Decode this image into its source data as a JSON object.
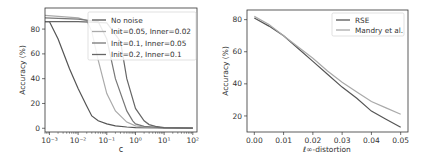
{
  "chart_data": [
    {
      "type": "line",
      "title": "",
      "xlabel": "c",
      "ylabel": "Accuracy (%)",
      "xscale": "log",
      "xlim": [
        0.0007,
        140
      ],
      "ylim": [
        -3,
        97
      ],
      "xticks": [
        0.001,
        0.01,
        0.1,
        1,
        10,
        100
      ],
      "xtick_labels": [
        "10⁻³",
        "10⁻²",
        "10⁻¹",
        "10⁰",
        "10¹",
        "10²"
      ],
      "yticks": [
        0,
        20,
        40,
        60,
        80
      ],
      "ytick_labels": [
        "0",
        "20",
        "40",
        "60",
        "80"
      ],
      "grid": false,
      "legend_position": "upper right",
      "series": [
        {
          "name": "No noise",
          "color": "#555555",
          "x": [
            0.0007,
            0.001,
            0.002,
            0.005,
            0.01,
            0.02,
            0.03,
            0.05,
            0.1,
            0.2,
            0.5,
            1,
            10,
            100
          ],
          "y": [
            86,
            86,
            72,
            48,
            32,
            18,
            10,
            6,
            3.5,
            2,
            1,
            0.5,
            0.2,
            0.1
          ]
        },
        {
          "name": "Init=0.05, Inner=0.02",
          "color": "#aaaaaa",
          "x": [
            0.0007,
            0.01,
            0.02,
            0.03,
            0.05,
            0.1,
            0.2,
            0.5,
            1,
            2,
            10,
            100
          ],
          "y": [
            91,
            89,
            87,
            78,
            55,
            28,
            14,
            5,
            2,
            1,
            0.3,
            0.1
          ]
        },
        {
          "name": "Init=0.1, Inner=0.05",
          "color": "#777777",
          "x": [
            0.0007,
            0.01,
            0.05,
            0.1,
            0.2,
            0.5,
            0.8,
            1,
            2,
            10,
            100
          ],
          "y": [
            89,
            88,
            86,
            72,
            40,
            14,
            6,
            3.5,
            1.5,
            0.3,
            0.1
          ]
        },
        {
          "name": "Init=0.2, Inner=0.1",
          "color": "#666666",
          "x": [
            0.0007,
            0.01,
            0.1,
            0.3,
            0.5,
            1,
            2,
            3,
            5,
            10,
            100
          ],
          "y": [
            86,
            86,
            85,
            70,
            40,
            16,
            6,
            3,
            1.5,
            0.5,
            0.1
          ]
        }
      ]
    },
    {
      "type": "line",
      "title": "",
      "xlabel": "ℓ∞-distortion",
      "ylabel": "Accuracy (%)",
      "xlim": [
        -0.0025,
        0.0525
      ],
      "ylim": [
        10,
        86
      ],
      "xticks": [
        0.0,
        0.01,
        0.02,
        0.03,
        0.04,
        0.05
      ],
      "xtick_labels": [
        "0.00",
        "0.01",
        "0.02",
        "0.03",
        "0.04",
        "0.05"
      ],
      "yticks": [
        20,
        40,
        60,
        80
      ],
      "ytick_labels": [
        "20",
        "40",
        "60",
        "80"
      ],
      "grid": false,
      "legend_position": "upper right",
      "series": [
        {
          "name": "RSE",
          "color": "#555555",
          "x": [
            0.0,
            0.005,
            0.01,
            0.015,
            0.02,
            0.025,
            0.03,
            0.035,
            0.04,
            0.045,
            0.05
          ],
          "y": [
            81,
            76,
            70,
            62,
            54,
            46,
            38,
            31,
            23,
            18,
            13
          ]
        },
        {
          "name": "Mandry et al.",
          "color": "#aaaaaa",
          "x": [
            0.0,
            0.005,
            0.01,
            0.015,
            0.02,
            0.025,
            0.03,
            0.035,
            0.04,
            0.045,
            0.05
          ],
          "y": [
            82,
            77,
            70,
            63,
            56,
            48,
            41,
            35,
            29,
            25,
            21
          ]
        }
      ]
    }
  ],
  "left_chart": {
    "xlabel": "c",
    "ylabel": "Accuracy (%)",
    "legend": [
      "No noise",
      "Init=0.05, Inner=0.02",
      "Init=0.1, Inner=0.05",
      "Init=0.2, Inner=0.1"
    ]
  },
  "right_chart": {
    "xlabel": "ℓ∞-distortion",
    "ylabel": "Accuracy (%)",
    "legend": [
      "RSE",
      "Mandry et al."
    ]
  }
}
